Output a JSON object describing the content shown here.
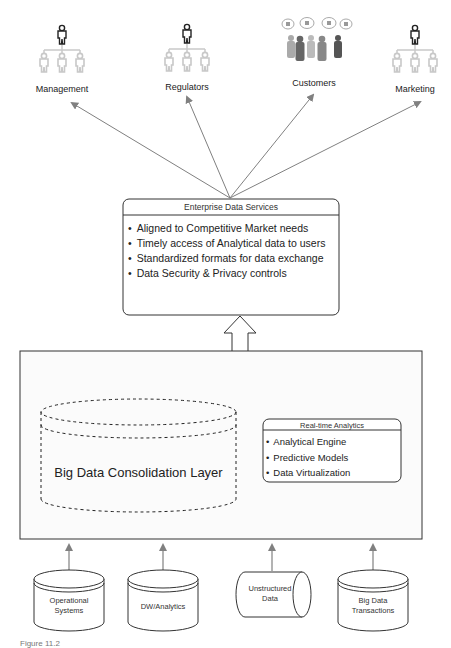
{
  "diagram": {
    "consumers": [
      {
        "label": "Management",
        "icon": "org-hierarchy-icon"
      },
      {
        "label": "Regulators",
        "icon": "org-hierarchy-icon"
      },
      {
        "label": "Customers",
        "icon": "customers-group-icon"
      },
      {
        "label": "Marketing",
        "icon": "org-hierarchy-icon"
      }
    ],
    "enterprise_services": {
      "title": "Enterprise Data Services",
      "items": [
        "Aligned to Competitive Market needs",
        "Timely access of Analytical data to users",
        "Standardized formats for data exchange",
        "Data Security & Privacy controls"
      ]
    },
    "consolidation_layer": {
      "label": "Big Data Consolidation Layer"
    },
    "realtime_analytics": {
      "title": "Real-time Analytics",
      "items": [
        "Analytical Engine",
        "Predictive Models",
        "Data Virtualization"
      ]
    },
    "sources": [
      {
        "line1": "Operational",
        "line2": "Systems"
      },
      {
        "line1": "DW/Analytics",
        "line2": ""
      },
      {
        "line1": "Unstructured",
        "line2": "Data"
      },
      {
        "line1": "Big Data",
        "line2": "Transactions"
      }
    ],
    "caption": "Figure 11.2"
  },
  "colors": {
    "line": "#333333",
    "arrow": "#808080",
    "person_dark": "#222222",
    "person_light": "#c8c8c8"
  }
}
